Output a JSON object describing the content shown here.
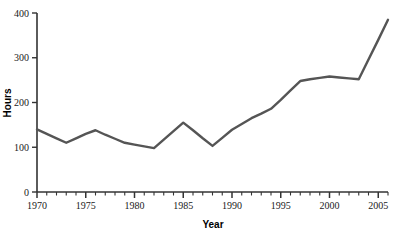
{
  "chart_data": {
    "type": "line",
    "title": "",
    "xlabel": "Year",
    "ylabel": "Hours",
    "xlim": [
      1970,
      2006
    ],
    "ylim": [
      0,
      400
    ],
    "grid": false,
    "legend": null,
    "line_color": "#555555",
    "axis_color": "#333333",
    "x": [
      1970,
      1971,
      1972,
      1973,
      1974,
      1975,
      1976,
      1977,
      1978,
      1979,
      1980,
      1981,
      1982,
      1983,
      1984,
      1985,
      1986,
      1987,
      1988,
      1989,
      1990,
      1991,
      1992,
      1993,
      1994,
      1995,
      1996,
      1997,
      1998,
      1999,
      2000,
      2001,
      2002,
      2003,
      2004,
      2005,
      2006
    ],
    "values": [
      140,
      130,
      120,
      110,
      120,
      130,
      138,
      128,
      119,
      110,
      106,
      102,
      98,
      117,
      136,
      155,
      138,
      120,
      103,
      121,
      139,
      152,
      165,
      175,
      186,
      206,
      227,
      248,
      252,
      255,
      258,
      256,
      254,
      252,
      296,
      340,
      385
    ],
    "xticks": [
      1970,
      1975,
      1980,
      1985,
      1990,
      1995,
      2000,
      2005
    ],
    "xtick_labels": [
      "1970",
      "1975",
      "1980",
      "1985",
      "1990",
      "1995",
      "2000",
      "2005"
    ],
    "xminor_tick_step": 1,
    "yticks": [
      0,
      100,
      200,
      300,
      400
    ],
    "ytick_labels": [
      "0",
      "100",
      "200",
      "300",
      "400"
    ],
    "annotations": []
  },
  "axes": {
    "y_axis_title": "Hours",
    "x_axis_title": "Year"
  }
}
